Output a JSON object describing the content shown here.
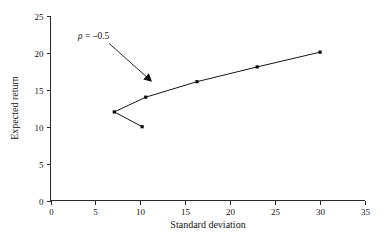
{
  "chart_data": {
    "type": "line",
    "title": "",
    "xlabel": "Standard deviation",
    "ylabel": "Expected return",
    "xlim": [
      0,
      35
    ],
    "ylim": [
      0,
      25
    ],
    "xticks": [
      0,
      5,
      10,
      15,
      20,
      25,
      30,
      35
    ],
    "yticks": [
      0,
      5,
      10,
      15,
      20,
      25
    ],
    "grid": false,
    "legend": null,
    "series": [
      {
        "name": "Efficient frontier (rho = -0.5)",
        "marker": "dot",
        "points": [
          {
            "x": 10.2,
            "y": 10.0
          },
          {
            "x": 7.1,
            "y": 12.0
          },
          {
            "x": 10.6,
            "y": 14.0
          },
          {
            "x": 16.3,
            "y": 16.1
          },
          {
            "x": 23.0,
            "y": 18.1
          },
          {
            "x": 30.0,
            "y": 20.1
          }
        ]
      }
    ],
    "annotations": [
      {
        "text": "rho = -0.5",
        "text_display": "ρ = –0.5",
        "text_x": 3.1,
        "text_y": 22.4,
        "arrow_from": {
          "x": 6.5,
          "y": 21.3
        },
        "arrow_to": {
          "x": 11.3,
          "y": 16.1
        }
      }
    ]
  },
  "axes": {
    "x_title": "Standard deviation",
    "y_title": "Expected return",
    "x_tick_labels": [
      "0",
      "5",
      "10",
      "15",
      "20",
      "25",
      "30",
      "35"
    ],
    "y_tick_labels": [
      "0",
      "5",
      "10",
      "15",
      "20",
      "25"
    ]
  },
  "annotation": {
    "rho_symbol": "ρ",
    "equals": " = ",
    "value": "–0.5"
  },
  "colors": {
    "line": "#151515",
    "marker": "#0d0d0d",
    "axis": "#2b2b2b",
    "text": "#111111",
    "background": "#ffffff"
  }
}
